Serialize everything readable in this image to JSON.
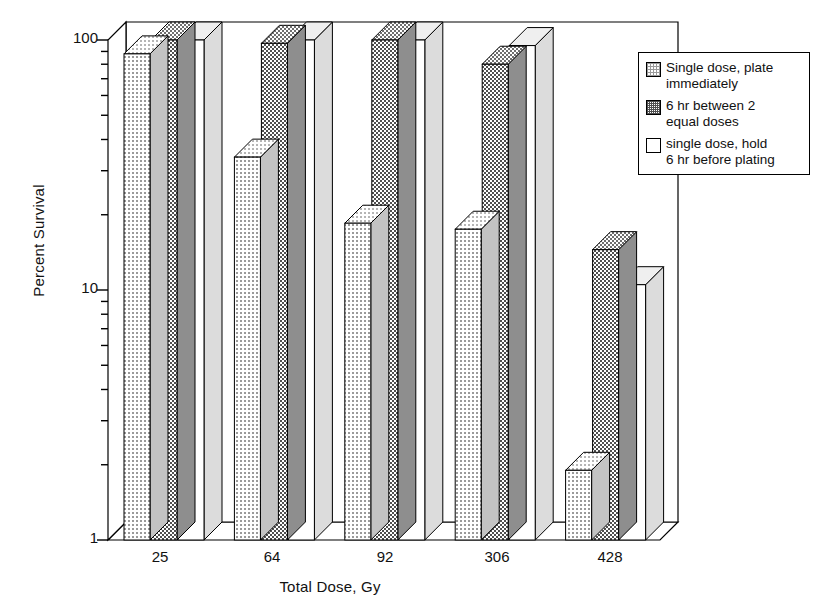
{
  "chart_data": {
    "type": "bar",
    "title": "",
    "xlabel": "Total Dose, Gy",
    "ylabel": "Percent Survival",
    "categories": [
      "25",
      "64",
      "92",
      "306",
      "428"
    ],
    "yscale": "log",
    "ylim": [
      1,
      100
    ],
    "ytick_labels": [
      "100",
      "10",
      "1"
    ],
    "ytick_values": [
      100,
      10,
      1
    ],
    "grid": false,
    "legend_position": "top-right",
    "three_d": true,
    "series": [
      {
        "name": "Single dose, plate immediately",
        "values": [
          88,
          34,
          18.5,
          17.5,
          1.9
        ]
      },
      {
        "name": "6 hr between 2 equal doses",
        "values": [
          100,
          97,
          100,
          80,
          14.5
        ]
      },
      {
        "name": "single dose, hold 6 hr before plating",
        "values": [
          100,
          100,
          100,
          95,
          10.5
        ]
      }
    ]
  },
  "legend": {
    "items": [
      {
        "swatch": "light-dotted-swatch",
        "line1": "Single dose, plate",
        "line2": "immediately"
      },
      {
        "swatch": "dark-checker-swatch",
        "line1": "6 hr between 2",
        "line2": "equal doses"
      },
      {
        "swatch": "white-swatch",
        "line1": "single dose, hold",
        "line2": "6 hr before plating"
      }
    ]
  },
  "axes": {
    "y_title": "Percent Survival",
    "x_title": "Total Dose, Gy",
    "y_labels": {
      "top": "100",
      "mid": "10",
      "bottom": "1"
    },
    "x_labels": [
      "25",
      "64",
      "92",
      "306",
      "428"
    ]
  },
  "colors": {
    "ink": "#111111",
    "series1_fill": "#d9d9d9",
    "series2_fill": "#a8a8a8",
    "series3_fill": "#ffffff",
    "top_face": "#e8e8e8",
    "side_face": "#bdbdbd"
  }
}
